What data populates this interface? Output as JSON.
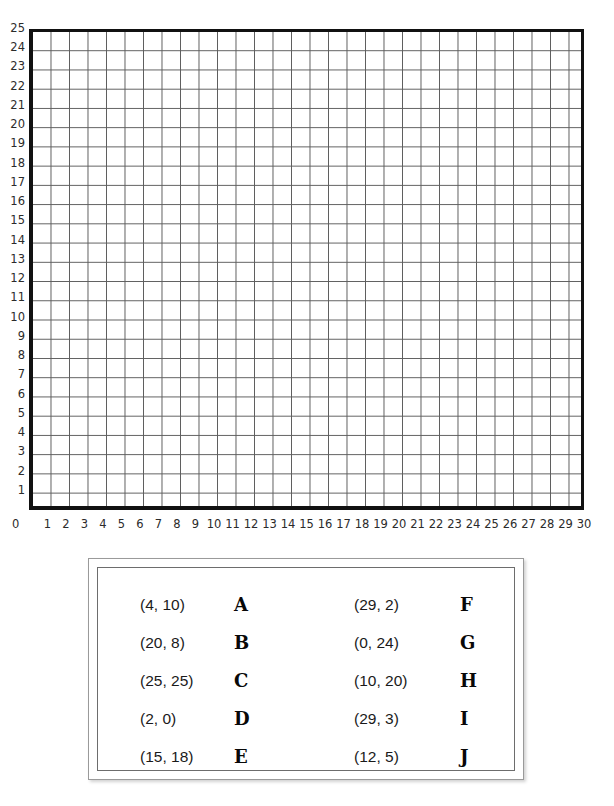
{
  "chart_data": {
    "type": "scatter",
    "title": "",
    "subtitle": "",
    "xlabel": "",
    "ylabel": "",
    "xlim": [
      0,
      30
    ],
    "ylim": [
      0,
      25
    ],
    "grid": true,
    "grid_minor": false,
    "legend_position": "below",
    "x_tick_labels": [
      "0",
      "1",
      "2",
      "3",
      "4",
      "5",
      "6",
      "7",
      "8",
      "9",
      "10",
      "11",
      "12",
      "13",
      "14",
      "15",
      "16",
      "17",
      "18",
      "19",
      "20",
      "21",
      "22",
      "23",
      "24",
      "25",
      "26",
      "27",
      "28",
      "29",
      "30"
    ],
    "y_tick_labels": [
      "1",
      "2",
      "3",
      "4",
      "5",
      "6",
      "7",
      "8",
      "9",
      "10",
      "11",
      "12",
      "13",
      "14",
      "15",
      "16",
      "17",
      "18",
      "19",
      "20",
      "21",
      "22",
      "23",
      "24",
      "25"
    ],
    "x_step": 1,
    "y_step": 1,
    "points_plotted": [],
    "labeled_points": [
      {
        "label": "A",
        "coord_text": "(4, 10)",
        "x": 4,
        "y": 10
      },
      {
        "label": "B",
        "coord_text": "(20, 8)",
        "x": 20,
        "y": 8
      },
      {
        "label": "C",
        "coord_text": "(25, 25)",
        "x": 25,
        "y": 25
      },
      {
        "label": "D",
        "coord_text": "(2, 0)",
        "x": 2,
        "y": 0
      },
      {
        "label": "E",
        "coord_text": "(15, 18)",
        "x": 15,
        "y": 18
      },
      {
        "label": "F",
        "coord_text": "(29, 2)",
        "x": 29,
        "y": 2
      },
      {
        "label": "G",
        "coord_text": "(0, 24)",
        "x": 0,
        "y": 24
      },
      {
        "label": "H",
        "coord_text": "(10, 20)",
        "x": 10,
        "y": 20
      },
      {
        "label": "I",
        "coord_text": "(29, 3)",
        "x": 29,
        "y": 3
      },
      {
        "label": "J",
        "coord_text": "(12, 5)",
        "x": 12,
        "y": 5
      }
    ]
  },
  "graph": {
    "origin_label": "0",
    "y_axis_ticks": [
      "25",
      "24",
      "23",
      "22",
      "21",
      "20",
      "19",
      "18",
      "17",
      "16",
      "15",
      "14",
      "13",
      "12",
      "11",
      "10",
      "9",
      "8",
      "7",
      "6",
      "5",
      "4",
      "3",
      "2",
      "1"
    ],
    "x_axis_ticks": [
      "1",
      "2",
      "3",
      "4",
      "5",
      "6",
      "7",
      "8",
      "9",
      "10",
      "11",
      "12",
      "13",
      "14",
      "15",
      "16",
      "17",
      "18",
      "19",
      "20",
      "21",
      "22",
      "23",
      "24",
      "25",
      "26",
      "27",
      "28",
      "29",
      "30"
    ]
  },
  "legend": {
    "column_1": [
      {
        "coord": "(4, 10)",
        "letter": "A"
      },
      {
        "coord": "(20, 8)",
        "letter": "B"
      },
      {
        "coord": "(25, 25)",
        "letter": "C"
      },
      {
        "coord": "(2, 0)",
        "letter": "D"
      },
      {
        "coord": "(15, 18)",
        "letter": "E"
      }
    ],
    "column_2": [
      {
        "coord": "(29, 2)",
        "letter": "F"
      },
      {
        "coord": "(0, 24)",
        "letter": "G"
      },
      {
        "coord": "(10, 20)",
        "letter": "H"
      },
      {
        "coord": "(29, 3)",
        "letter": "I"
      },
      {
        "coord": "(12, 5)",
        "letter": "J"
      }
    ]
  },
  "colors": {
    "grid_line": "#5d5d5d",
    "axis_border": "#111111",
    "tick_text": "#2b2b2b",
    "legend_outer_border": "#9a9a9a",
    "legend_inner_border": "#6d6d6d",
    "page_background": "#ffffff"
  }
}
